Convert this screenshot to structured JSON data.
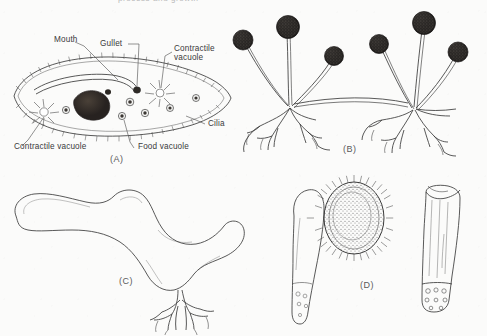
{
  "figure": {
    "cut_header_text": "process and growth",
    "background_color": "#fbfbfa",
    "ink_color": "#3b3b3b"
  },
  "panels": [
    {
      "id": "A",
      "label": "(A)",
      "name": "paramecium-diagram",
      "labels": [
        {
          "text": "Mouth",
          "name": "label-mouth"
        },
        {
          "text": "Gullet",
          "name": "label-gullet"
        },
        {
          "text": "Contractile vacuole",
          "name": "label-contractile-vacuole-upper"
        },
        {
          "text": "Cilia",
          "name": "label-cilia"
        },
        {
          "text": "Contractile vacuole",
          "name": "label-contractile-vacuole-lower"
        },
        {
          "text": "Food vacuole",
          "name": "label-food-vacuole"
        }
      ]
    },
    {
      "id": "B",
      "label": "(B)",
      "name": "sporangiophore-clusters"
    },
    {
      "id": "C",
      "label": "(C)",
      "name": "branching-filament"
    },
    {
      "id": "D",
      "label": "(D)",
      "name": "cell-forms-group"
    }
  ]
}
